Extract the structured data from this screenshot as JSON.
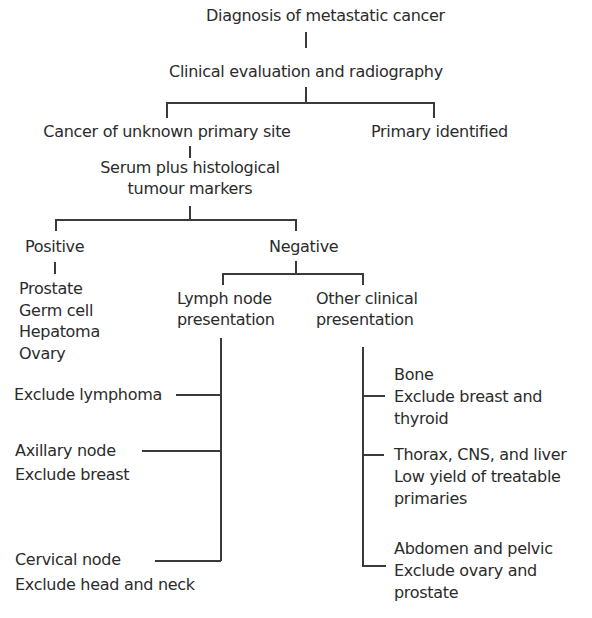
{
  "diagram": {
    "type": "flowchart",
    "nodes": {
      "root": "Diagnosis of metastatic cancer",
      "clinical": "Clinical evaluation and radiography",
      "unknown": "Cancer of unknown primary site",
      "identified": "Primary identified",
      "serum_line1": "Serum plus histological",
      "serum_line2": "tumour markers",
      "positive": "Positive",
      "negative": "Negative",
      "positive_list": [
        "Prostate",
        "Germ cell",
        "Hepatoma",
        "Ovary"
      ],
      "lymph_line1": "Lymph node",
      "lymph_line2": "presentation",
      "other_line1": "Other clinical",
      "other_line2": "presentation",
      "lymph_items": [
        {
          "lines": [
            "Exclude lymphoma"
          ]
        },
        {
          "lines": [
            "Axillary node",
            "Exclude breast"
          ]
        },
        {
          "lines": [
            "Cervical node",
            "Exclude head and neck"
          ]
        }
      ],
      "other_items": [
        {
          "lines": [
            "Bone",
            "Exclude breast and",
            "thyroid"
          ]
        },
        {
          "lines": [
            "Thorax, CNS, and liver",
            "Low yield of treatable",
            "primaries"
          ]
        },
        {
          "lines": [
            "Abdomen and pelvic",
            "Exclude ovary and",
            "prostate"
          ]
        }
      ]
    },
    "edges": [
      [
        "root",
        "clinical"
      ],
      [
        "clinical",
        "unknown"
      ],
      [
        "clinical",
        "identified"
      ],
      [
        "unknown",
        "serum"
      ],
      [
        "serum",
        "positive"
      ],
      [
        "serum",
        "negative"
      ],
      [
        "positive",
        "positive_list"
      ],
      [
        "negative",
        "lymph"
      ],
      [
        "negative",
        "other"
      ],
      [
        "lymph",
        "lymph_items"
      ],
      [
        "other",
        "other_items"
      ]
    ]
  }
}
